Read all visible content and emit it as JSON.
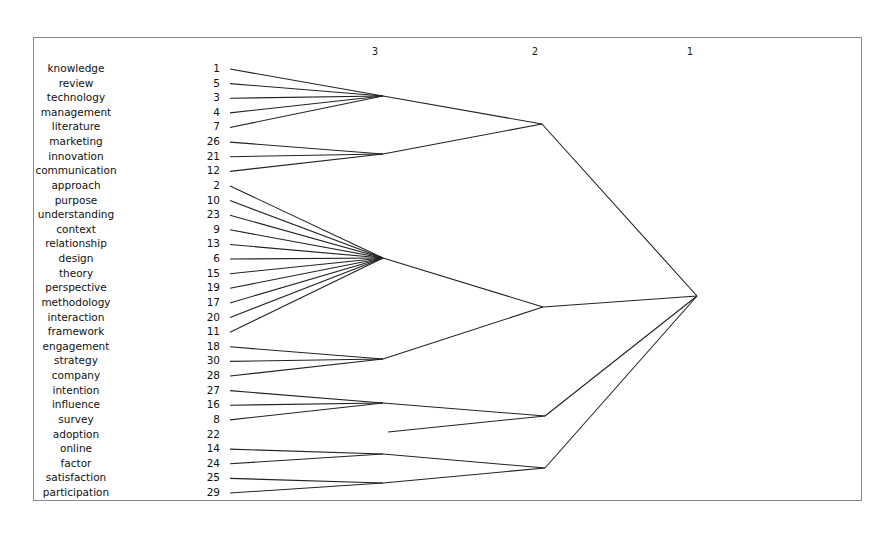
{
  "chart_data": {
    "type": "dendrogram",
    "orientation": "left-to-right",
    "level_labels": [
      {
        "label": "3",
        "x": 375
      },
      {
        "label": "2",
        "x": 535
      },
      {
        "label": "1",
        "x": 690
      }
    ],
    "leaves": [
      {
        "term": "knowledge",
        "id": "1"
      },
      {
        "term": "review",
        "id": "5"
      },
      {
        "term": "technology",
        "id": "3"
      },
      {
        "term": "management",
        "id": "4"
      },
      {
        "term": "literature",
        "id": "7"
      },
      {
        "term": "marketing",
        "id": "26"
      },
      {
        "term": "innovation",
        "id": "21"
      },
      {
        "term": "communication",
        "id": "12"
      },
      {
        "term": "approach",
        "id": "2"
      },
      {
        "term": "purpose",
        "id": "10"
      },
      {
        "term": "understanding",
        "id": "23"
      },
      {
        "term": "context",
        "id": "9"
      },
      {
        "term": "relationship",
        "id": "13"
      },
      {
        "term": "design",
        "id": "6"
      },
      {
        "term": "theory",
        "id": "15"
      },
      {
        "term": "perspective",
        "id": "19"
      },
      {
        "term": "methodology",
        "id": "17"
      },
      {
        "term": "interaction",
        "id": "20"
      },
      {
        "term": "framework",
        "id": "11"
      },
      {
        "term": "engagement",
        "id": "18"
      },
      {
        "term": "strategy",
        "id": "30"
      },
      {
        "term": "company",
        "id": "28"
      },
      {
        "term": "intention",
        "id": "27"
      },
      {
        "term": "influence",
        "id": "16"
      },
      {
        "term": "survey",
        "id": "8"
      },
      {
        "term": "adoption",
        "id": "22"
      },
      {
        "term": "online",
        "id": "14"
      },
      {
        "term": "factor",
        "id": "24"
      },
      {
        "term": "satisfaction",
        "id": "25"
      },
      {
        "term": "participation",
        "id": "29"
      }
    ],
    "level3_clusters": [
      {
        "members": [
          0,
          1,
          2,
          3,
          4
        ],
        "node": [
          383,
          96
        ]
      },
      {
        "members": [
          5,
          6,
          7
        ],
        "node": [
          383,
          154
        ]
      },
      {
        "members": [
          8,
          9,
          10,
          11,
          12,
          13,
          14,
          15,
          16,
          17,
          18
        ],
        "node": [
          383,
          258
        ]
      },
      {
        "members": [
          19,
          20,
          21
        ],
        "node": [
          383,
          359
        ]
      },
      {
        "members": [
          22,
          23,
          24
        ],
        "node": [
          383,
          403
        ]
      },
      {
        "members": [
          26,
          27
        ],
        "node": [
          383,
          454
        ]
      },
      {
        "members": [
          28,
          29
        ],
        "node": [
          383,
          483
        ]
      }
    ],
    "level2_clusters": [
      {
        "children": [
          0,
          1
        ],
        "node": [
          542,
          124
        ]
      },
      {
        "children": [
          2,
          3
        ],
        "node": [
          543,
          307
        ]
      },
      {
        "children": [
          4
        ],
        "extra_leaf": 25,
        "extra_leaf_start": [
          388,
          432
        ],
        "node": [
          545,
          416
        ]
      },
      {
        "children": [
          5,
          6
        ],
        "node": [
          545,
          468
        ]
      }
    ],
    "root": {
      "children": [
        0,
        1,
        2,
        3
      ],
      "node": [
        697,
        296
      ]
    }
  }
}
